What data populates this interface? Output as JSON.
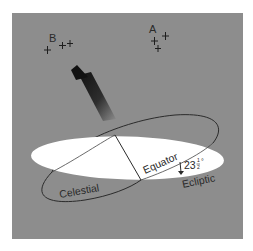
{
  "diagram": {
    "background_color": "#8d8d8d",
    "equator_fill": "#ffffff",
    "line_color": "#2b2b2b",
    "labels": {
      "group_b": "B",
      "group_a": "A",
      "celestial": "Celestial",
      "equator": "Equator",
      "ecliptic": "Ecliptic",
      "angle_whole": "23",
      "angle_frac_num": "1",
      "angle_frac_den": "2",
      "angle_degree": "°"
    },
    "star_groups": [
      {
        "label": "B",
        "stars": 3
      },
      {
        "label": "A",
        "stars": 3
      }
    ],
    "icons": {
      "star_marker": "plus-cross-icon",
      "direction_arrow": "arrow-up-left-icon",
      "angle_arrow": "arrow-down-icon"
    }
  }
}
